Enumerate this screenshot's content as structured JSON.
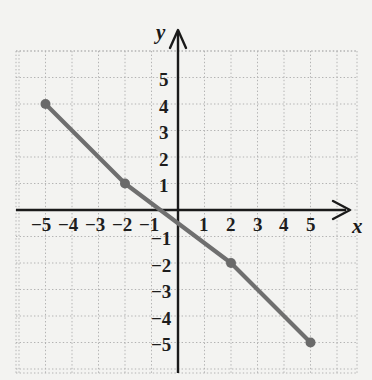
{
  "chart_data": {
    "type": "line",
    "title": "",
    "subtitle": "",
    "xlabel": "x",
    "ylabel": "y",
    "grid": true,
    "legend": "none",
    "xlim": [
      -5.9,
      6.2
    ],
    "ylim": [
      -6.3,
      6.0
    ],
    "x_ticks": [
      -5,
      -4,
      -3,
      -2,
      -1,
      1,
      2,
      3,
      4,
      5
    ],
    "y_ticks": [
      5,
      4,
      3,
      2,
      1,
      -1,
      -2,
      -3,
      -4,
      -5
    ],
    "x_tick_labels": [
      "−5",
      "−4",
      "−3",
      "−2",
      "−1",
      "1",
      "2",
      "3",
      "4",
      "5"
    ],
    "y_tick_labels": [
      "5",
      "4",
      "3",
      "2",
      "1",
      "−1",
      "−2",
      "−3",
      "−4",
      "−5"
    ],
    "series": [
      {
        "name": "line",
        "type": "line",
        "color": "#6f6f6f",
        "marker": "circle",
        "marker_color": "#6a6a6a",
        "x": [
          -5,
          -2,
          2,
          5
        ],
        "y": [
          4,
          1,
          -2,
          -5
        ],
        "points": [
          {
            "x": -5,
            "y": 4
          },
          {
            "x": -2,
            "y": 1
          },
          {
            "x": 2,
            "y": -2
          },
          {
            "x": 5,
            "y": -5
          }
        ]
      }
    ],
    "annotations": []
  },
  "axes": {
    "x_axis_label": "x",
    "y_axis_label": "y",
    "x_axis_arrow": "arrow-right",
    "y_axis_arrow": "arrow-up"
  },
  "colors": {
    "background": "#f3f3f1",
    "axis": "#1a1a1a",
    "grid": "#b9b9b9",
    "data_line": "#6f6f6f",
    "data_point": "#6a6a6a",
    "tick_text": "#1d1d1d"
  },
  "ticks": {
    "x": [
      {
        "label": "−5",
        "left": 31,
        "top": 215
      },
      {
        "label": "−4",
        "left": 58,
        "top": 215
      },
      {
        "label": "−3",
        "left": 85,
        "top": 215
      },
      {
        "label": "−2",
        "left": 112,
        "top": 215
      },
      {
        "label": "−1",
        "left": 139,
        "top": 215
      },
      {
        "label": "1",
        "left": 199,
        "top": 215
      },
      {
        "label": "2",
        "left": 226,
        "top": 215
      },
      {
        "label": "3",
        "left": 253,
        "top": 215
      },
      {
        "label": "4",
        "left": 279,
        "top": 215
      },
      {
        "label": "5",
        "left": 306,
        "top": 215
      }
    ],
    "y": [
      {
        "label": "5",
        "left": 159,
        "top": 70
      },
      {
        "label": "4",
        "left": 159,
        "top": 97
      },
      {
        "label": "3",
        "left": 159,
        "top": 123
      },
      {
        "label": "2",
        "left": 159,
        "top": 150
      },
      {
        "label": "1",
        "left": 159,
        "top": 176
      },
      {
        "label": "−1",
        "left": 151,
        "top": 229
      },
      {
        "label": "−2",
        "left": 151,
        "top": 256
      },
      {
        "label": "−3",
        "left": 151,
        "top": 282
      },
      {
        "label": "−4",
        "left": 151,
        "top": 309
      },
      {
        "label": "−5",
        "left": 151,
        "top": 335
      }
    ]
  },
  "labels": {
    "x_name": {
      "text": "x",
      "left": 352,
      "top": 216
    },
    "y_name": {
      "text": "y",
      "left": 156,
      "top": 22
    }
  }
}
